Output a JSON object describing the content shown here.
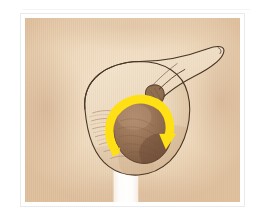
{
  "header": {
    "left_text": "",
    "center_text": "",
    "right_text": "",
    "note": "header text illegible at source resolution"
  },
  "figure": {
    "caption": "",
    "frame_border_color": "#e8eaec",
    "frame_background": "#ffffff"
  },
  "illustration": {
    "name": "testicular-torsion-bell-clapper",
    "background_color": "#f6e3ca",
    "background_vignette_color": "#e4c6a3",
    "skin_fill_color": "#f0ddc2",
    "skin_shadow_color": "#e0c6a4",
    "outline_color": "#4a3626",
    "testis_fill_color": "#9a7254",
    "testis_shadow_color": "#7d5942",
    "testis_highlight_color": "#ab8668",
    "cord_color": "#8a6648",
    "arrow_color": "#ffe014",
    "arrow_direction": "clockwise",
    "arrow_label": "rotation-arrow",
    "shaft_color": "#ffffff",
    "parts": [
      {
        "id": "scrotum-outline",
        "label": "scrotal sac"
      },
      {
        "id": "rugae-lines",
        "label": "scrotal rugae"
      },
      {
        "id": "spermatic-cord",
        "label": "spermatic cord"
      },
      {
        "id": "testis",
        "label": "testis"
      },
      {
        "id": "torsion-arrow",
        "label": "direction of torsion"
      },
      {
        "id": "penile-shaft",
        "label": "shaft"
      }
    ]
  }
}
